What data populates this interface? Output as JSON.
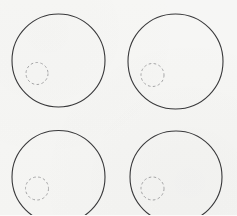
{
  "figure": {
    "background_color": "#fbfbfa",
    "canvas": {
      "width": 237,
      "height": 215
    }
  },
  "style": {
    "outer_stroke_color": "#3a3a3c",
    "outer_stroke_width": 1.1,
    "inner_stroke_color": "#a9a9ab",
    "inner_stroke_width": 1.0,
    "inner_dash_pattern": "2.6 2.4"
  },
  "shapes": {
    "outer_circles": [
      {
        "name": "outer-circle-top-left",
        "cx": 58.5,
        "cy": 60.5,
        "r": 46.5
      },
      {
        "name": "outer-circle-top-right",
        "cx": 175.5,
        "cy": 61.5,
        "r": 47.5
      },
      {
        "name": "outer-circle-bottom-left",
        "cx": 58.5,
        "cy": 177.0,
        "r": 46.5
      },
      {
        "name": "outer-circle-bottom-right",
        "cx": 176.0,
        "cy": 177.0,
        "r": 46.0
      }
    ],
    "inner_circles": [
      {
        "name": "inner-dashed-circle-top-left",
        "cx": 37.0,
        "cy": 73.5,
        "r": 11.0
      },
      {
        "name": "inner-dashed-circle-top-right",
        "cx": 152.5,
        "cy": 75.0,
        "r": 11.5
      },
      {
        "name": "inner-dashed-circle-bottom-left",
        "cx": 37.0,
        "cy": 188.5,
        "r": 11.5
      },
      {
        "name": "inner-dashed-circle-bottom-right",
        "cx": 152.5,
        "cy": 188.5,
        "r": 11.5
      }
    ]
  },
  "chart_data": {
    "type": "scatter",
    "title": "",
    "xlabel": "",
    "ylabel": "",
    "xlim": [
      0,
      237
    ],
    "ylim": [
      0,
      215
    ],
    "grid": false,
    "legend": null,
    "series": [
      {
        "name": "large outline circles",
        "marker": "open-circle",
        "stroke": "#3a3a3c",
        "radii": [
          46.5,
          47.5,
          46.5,
          46.0
        ],
        "x": [
          58.5,
          175.5,
          58.5,
          176.0
        ],
        "y": [
          60.5,
          61.5,
          177.0,
          177.0
        ]
      },
      {
        "name": "small dashed circles",
        "marker": "dashed-circle",
        "stroke": "#a9a9ab",
        "radii": [
          11.0,
          11.5,
          11.5,
          11.5
        ],
        "x": [
          37.0,
          152.5,
          37.0,
          152.5
        ],
        "y": [
          73.5,
          75.0,
          188.5,
          188.5
        ]
      }
    ]
  }
}
